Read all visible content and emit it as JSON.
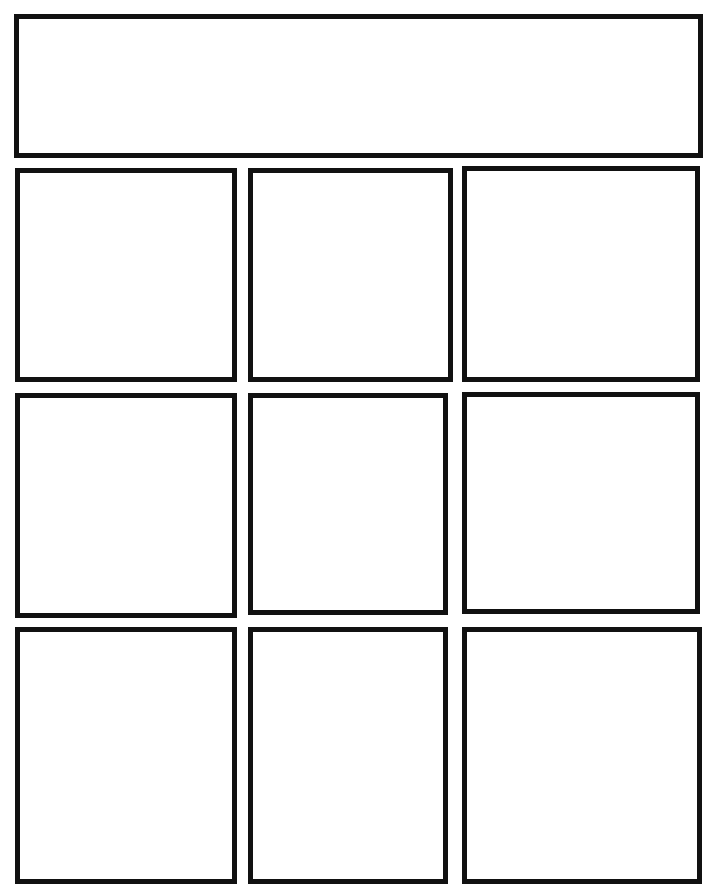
{
  "page": {
    "type": "comic-panel-template",
    "border_color": "#111111",
    "background": "#ffffff"
  },
  "panels": [
    {
      "id": "title-panel",
      "x": 14,
      "y": 14,
      "w": 689,
      "h": 144
    },
    {
      "id": "panel-r1c1",
      "x": 15,
      "y": 168,
      "w": 222,
      "h": 214
    },
    {
      "id": "panel-r1c2",
      "x": 248,
      "y": 168,
      "w": 205,
      "h": 214
    },
    {
      "id": "panel-r2c1",
      "x": 15,
      "y": 393,
      "w": 222,
      "h": 225
    },
    {
      "id": "panel-r2c2",
      "x": 248,
      "y": 393,
      "w": 200,
      "h": 222
    },
    {
      "id": "panel-r1c3",
      "x": 462,
      "y": 166,
      "w": 238,
      "h": 216
    },
    {
      "id": "panel-r2c3",
      "x": 462,
      "y": 392,
      "w": 238,
      "h": 222
    },
    {
      "id": "panel-r3c1",
      "x": 15,
      "y": 627,
      "w": 222,
      "h": 257
    },
    {
      "id": "panel-r3c2",
      "x": 248,
      "y": 627,
      "w": 200,
      "h": 257
    },
    {
      "id": "panel-r3c3",
      "x": 462,
      "y": 627,
      "w": 240,
      "h": 257
    }
  ]
}
